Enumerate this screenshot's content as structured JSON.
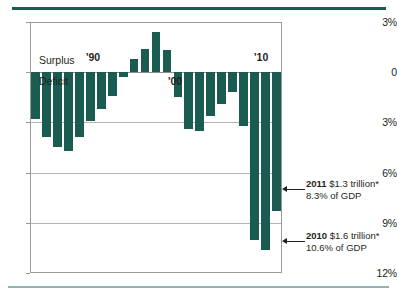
{
  "chart_data": {
    "type": "bar",
    "title": "",
    "subtitle": "",
    "xlabel": "",
    "ylabel": "",
    "ylim": [
      -12,
      3
    ],
    "yticks": [
      3,
      0,
      -3,
      -6,
      -9,
      -12
    ],
    "ytick_labels": [
      "3%",
      "0",
      "3%",
      "6%",
      "9%",
      "12%"
    ],
    "grid": true,
    "legend": "none",
    "axis_note": "Values below zero are deficits; tick labels are shown unsigned.",
    "zero_labels": {
      "above": "Surplus",
      "below": "Deficit"
    },
    "x_axis_labels": [
      {
        "text": "'90",
        "x_pct": 25.8
      },
      {
        "text": "'00",
        "x_pct": 58.3
      },
      {
        "text": "'10",
        "x_pct": 92.5
      }
    ],
    "categories": [
      "'89",
      "'90",
      "'91",
      "'92",
      "'93",
      "'94",
      "'95",
      "'96",
      "'97",
      "'98",
      "'99",
      "'00",
      "'01",
      "'02",
      "'03",
      "'04",
      "'05",
      "'06",
      "'07",
      "'08",
      "'09",
      "'10",
      "'11"
    ],
    "values": [
      -2.8,
      -3.9,
      -4.5,
      -4.7,
      -3.9,
      -2.9,
      -2.2,
      -1.4,
      -0.3,
      0.8,
      1.4,
      2.4,
      1.3,
      -1.5,
      -3.4,
      -3.5,
      -2.6,
      -1.9,
      -1.2,
      -3.2,
      -10.0,
      -10.6,
      -8.3
    ],
    "series_name": "Federal surplus / deficit as share of GDP",
    "bar_color": "#1a5c52",
    "annotations": [
      {
        "target": "'11",
        "line1_year": "2011",
        "line1_value": "$1.3 trillion*",
        "line2": "8.3% of GDP"
      },
      {
        "target": "'10",
        "line1_year": "2010",
        "line1_value": "$1.6 trillion*",
        "line2": "10.6% of GDP"
      }
    ]
  },
  "decor": {
    "rule_top_color": "#0f6157",
    "rule_bottom_color": "#8fb5b2"
  }
}
